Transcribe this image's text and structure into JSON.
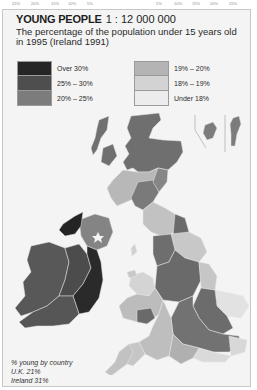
{
  "top_axis": {
    "left_ticks": [
      "25%",
      "20%",
      "15%",
      "10%",
      "5%"
    ],
    "right_ticks": [
      "5%",
      "10%",
      "15%",
      "20%",
      "25%"
    ]
  },
  "header": {
    "title": "YOUNG PEOPLE",
    "scale": "1 : 12 000 000",
    "subtitle": "The percentage of the population under 15 years old in 1995 (Ireland 1991)"
  },
  "legend": {
    "left": [
      {
        "label": "Over 30%",
        "color": "#262626"
      },
      {
        "label": "25% – 30%",
        "color": "#4e4e4e"
      },
      {
        "label": "20% – 25%",
        "color": "#7c7c7c"
      }
    ],
    "right": [
      {
        "label": "19% – 20%",
        "color": "#b4b4b4"
      },
      {
        "label": "18% – 19%",
        "color": "#d3d3d3"
      },
      {
        "label": "Under 18%",
        "color": "#ececec"
      }
    ]
  },
  "footnote": {
    "heading": "% young by country",
    "lines": [
      "U.K. 21%",
      "Ireland 31%"
    ]
  },
  "map": {
    "border_color": "#c8c8c8",
    "panel_bg": "#f4f4f4",
    "region_line_color": "#e6e6e6"
  }
}
